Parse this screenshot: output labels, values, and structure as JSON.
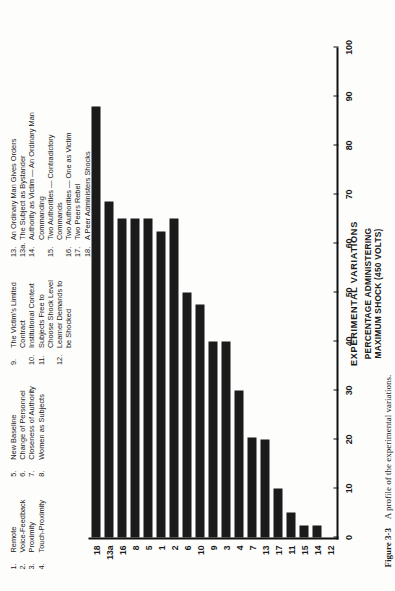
{
  "figure": {
    "caption_number": "Figure 3-3",
    "caption_text": "A profile of the experimental variations."
  },
  "legend": {
    "columns": [
      {
        "items": [
          {
            "num": "1.",
            "text": "Remote"
          },
          {
            "num": "2.",
            "text": "Voice-Feedback"
          },
          {
            "num": "3.",
            "text": "Proximity"
          },
          {
            "num": "4.",
            "text": "Touch-Proximity"
          }
        ]
      },
      {
        "items": [
          {
            "num": "5.",
            "text": "New Baseline"
          },
          {
            "num": "6.",
            "text": "Change of Personnel"
          },
          {
            "num": "7.",
            "text": "Closeness of Authority"
          },
          {
            "num": "8.",
            "text": "Women as Subjects"
          }
        ]
      },
      {
        "items": [
          {
            "num": "9.",
            "text": "The Victim's Limited\nContract"
          },
          {
            "num": "10.",
            "text": "Institutional Context"
          },
          {
            "num": "11.",
            "text": "Subjects Free to\nChoose Shock Level"
          },
          {
            "num": "12.",
            "text": "Learner Demands to\nbe Shocked"
          }
        ]
      },
      {
        "items": [
          {
            "num": "13.",
            "text": "An Ordinary Man Gives Orders"
          },
          {
            "num": "13a.",
            "text": "The Subject as Bystander"
          },
          {
            "num": "14.",
            "text": "Authority as Victim — An Ordinary Man Commanding"
          },
          {
            "num": "15.",
            "text": "Two Authorities — Contradictory Commands"
          },
          {
            "num": "16.",
            "text": "Two Authorities — One as Victim"
          },
          {
            "num": "17.",
            "text": "Two Peers Rebel"
          },
          {
            "num": "18.",
            "text": "A Peer Administers Shocks"
          }
        ]
      }
    ]
  },
  "chart_data": {
    "type": "bar",
    "orientation": "horizontal-rotated",
    "title": "",
    "xlabel": "EXPERIMENTAL VARIATIONS",
    "ylabel": "PERCENTAGE ADMINISTERING\nMAXIMUM SHOCK (450 VOLTS)",
    "ylabel_line1": "PERCENTAGE ADMINISTERING",
    "ylabel_line2": "MAXIMUM SHOCK (450 VOLTS)",
    "ylim": [
      0,
      100
    ],
    "ytick_values": [
      0,
      10,
      20,
      30,
      40,
      50,
      60,
      70,
      80,
      90,
      100
    ],
    "ytick_labels": [
      "0",
      "10",
      "20",
      "30",
      "40",
      "50",
      "60",
      "70",
      "80",
      "90",
      "100"
    ],
    "grid": false,
    "legend_position": "top",
    "bar_color": "#1b1b1b",
    "categories": [
      "12",
      "14",
      "15",
      "11",
      "17",
      "13",
      "7",
      "4",
      "3",
      "9",
      "10",
      "6",
      "2",
      "1",
      "5",
      "8",
      "16",
      "13a",
      "18"
    ],
    "values": [
      0,
      2.5,
      2.5,
      5,
      10,
      20,
      20.5,
      30,
      40,
      40,
      47.5,
      50,
      65,
      62.5,
      65,
      65,
      65,
      68.5,
      88
    ],
    "series": [
      {
        "name": "Percentage administering maximum shock",
        "values": [
          0,
          2.5,
          2.5,
          5,
          10,
          20,
          20.5,
          30,
          40,
          40,
          47.5,
          50,
          65,
          62.5,
          65,
          65,
          65,
          68.5,
          88
        ]
      }
    ]
  }
}
